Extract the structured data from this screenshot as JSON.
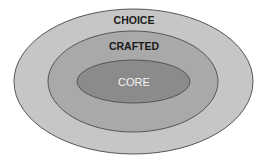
{
  "diagram": {
    "type": "nested-ellipses",
    "layers": [
      {
        "name": "outer",
        "label": "CHOICE",
        "fill": "#c6c6c6",
        "label_color": "#1a1a1a"
      },
      {
        "name": "middle",
        "label": "CRAFTED",
        "fill": "#a9a9a9",
        "label_color": "#1a1a1a"
      },
      {
        "name": "inner",
        "label": "CORE",
        "fill": "#8b8b8b",
        "label_color": "#f4f4f4"
      }
    ],
    "stroke": "#555555",
    "background": "#ffffff"
  }
}
